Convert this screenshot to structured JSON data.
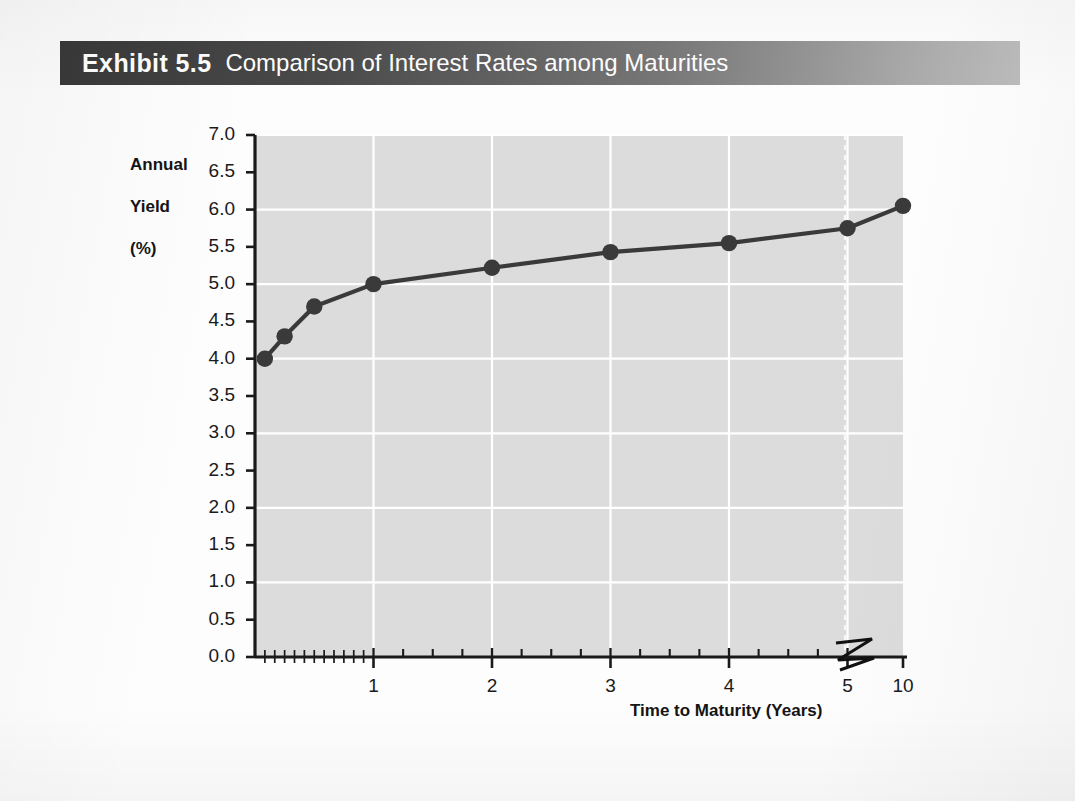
{
  "banner": {
    "exhibit_label": "Exhibit 5.5",
    "title": "Comparison of Interest Rates among Maturities",
    "gradient_dark": "#393939",
    "gradient_light": "#bdbdbd"
  },
  "chart_data": {
    "type": "line",
    "title": "Comparison of Interest Rates among Maturities",
    "xlabel": "Time to Maturity (Years)",
    "ylabel": "Annual Yield (%)",
    "ylabel_lines": [
      "Annual",
      "Yield",
      "(%)"
    ],
    "xlim": [
      0,
      10
    ],
    "ylim": [
      0.0,
      7.0
    ],
    "grid": true,
    "legend": "none",
    "axis_break": {
      "present": true,
      "between": [
        5,
        10
      ],
      "symbol": "zigzag"
    },
    "plot_background": "#dcdcdc",
    "gridline_color": "#ffffff",
    "series_color": "#3a3a3a",
    "marker": "circle",
    "y_ticks": [
      "0.0",
      "0.5",
      "1.0",
      "1.5",
      "2.0",
      "2.5",
      "3.0",
      "3.5",
      "4.0",
      "4.5",
      "5.0",
      "5.5",
      "6.0",
      "6.5",
      "7.0"
    ],
    "y_tick_values": [
      0.0,
      0.5,
      1.0,
      1.5,
      2.0,
      2.5,
      3.0,
      3.5,
      4.0,
      4.5,
      5.0,
      5.5,
      6.0,
      6.5,
      7.0
    ],
    "x_ticks": [
      "1",
      "2",
      "3",
      "4",
      "5",
      "10"
    ],
    "x_tick_values": [
      1,
      2,
      3,
      4,
      5,
      10
    ],
    "x": [
      0.083,
      0.25,
      0.5,
      1,
      2,
      3,
      4,
      5,
      10
    ],
    "values": [
      4.0,
      4.3,
      4.7,
      5.0,
      5.22,
      5.43,
      5.55,
      5.75,
      6.05
    ],
    "points": [
      {
        "maturity": "1 month",
        "years": 0.083,
        "yield": 4.0
      },
      {
        "maturity": "3 months",
        "years": 0.25,
        "yield": 4.3
      },
      {
        "maturity": "6 months",
        "years": 0.5,
        "yield": 4.7
      },
      {
        "maturity": "1 year",
        "years": 1,
        "yield": 5.0
      },
      {
        "maturity": "2 years",
        "years": 2,
        "yield": 5.22
      },
      {
        "maturity": "3 years",
        "years": 3,
        "yield": 5.43
      },
      {
        "maturity": "4 years",
        "years": 4,
        "yield": 5.55
      },
      {
        "maturity": "5 years",
        "years": 5,
        "yield": 5.75
      },
      {
        "maturity": "10 years",
        "years": 10,
        "yield": 6.05
      }
    ]
  }
}
